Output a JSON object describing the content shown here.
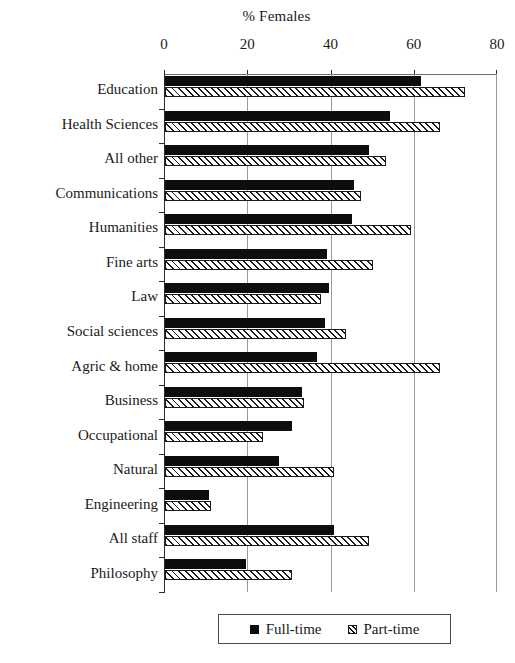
{
  "chart_data": {
    "type": "bar",
    "orientation": "horizontal",
    "title": "% Females",
    "xlabel": "",
    "ylabel": "",
    "xlim": [
      0,
      80
    ],
    "xticks": [
      0,
      20,
      40,
      60,
      80
    ],
    "xtick_labels": [
      "0",
      "20",
      "40",
      "60",
      "80"
    ],
    "grid": true,
    "legend_position": "bottom",
    "categories": [
      "Education",
      "Health Sciences",
      "All other",
      "Communications",
      "Humanities",
      "Fine arts",
      "Law",
      "Social sciences",
      "Agric & home",
      "Business",
      "Occupational",
      "Natural",
      "Engineering",
      "All staff",
      "Philosophy"
    ],
    "series": [
      {
        "name": "Full-time",
        "color": "#0d0d0d",
        "pattern": "solid",
        "values": [
          61.5,
          54,
          49,
          45.5,
          45,
          39,
          39.5,
          38.5,
          36.5,
          33,
          30.5,
          27.5,
          10.5,
          40.5,
          19.5
        ]
      },
      {
        "name": "Part-time",
        "color": "#ffffff",
        "pattern": "hatched",
        "values": [
          72,
          66,
          53,
          47,
          59,
          50,
          37.5,
          43.5,
          66,
          33.5,
          23.5,
          40.5,
          11,
          49,
          30.5
        ]
      }
    ]
  },
  "legend": {
    "items": [
      {
        "label": "Full-time",
        "marker": "solid-square-icon"
      },
      {
        "label": "Part-time",
        "marker": "hatched-square-icon"
      }
    ]
  }
}
